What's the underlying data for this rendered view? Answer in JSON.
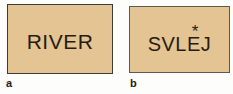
{
  "figure": {
    "panels": [
      {
        "label": "a",
        "text": "RIVER"
      },
      {
        "label": "b",
        "text_prefix": "SVL",
        "starred_letter": "E",
        "star": "*",
        "text_suffix": "J"
      }
    ],
    "colors": {
      "page_background": "#fdfdfc",
      "card_background": "#e3c492",
      "card_border_a": "#3f3c36",
      "card_border_b": "#5d594f",
      "text": "#261c12",
      "label": "#1f1c18"
    }
  }
}
